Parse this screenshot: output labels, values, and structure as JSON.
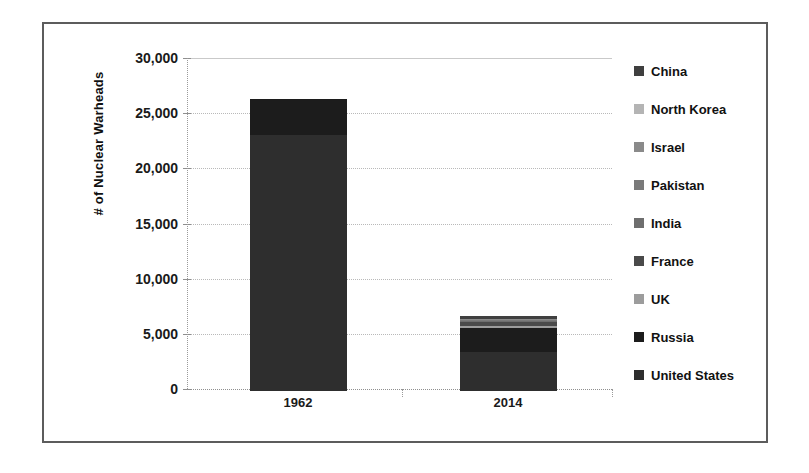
{
  "chart_data": {
    "type": "bar",
    "subtype": "stacked",
    "title": "",
    "xlabel": "",
    "ylabel": "# of Nuclear Warheads",
    "categories": [
      "1962",
      "2014"
    ],
    "ylim": [
      0,
      30000
    ],
    "yticks": [
      0,
      5000,
      10000,
      15000,
      20000,
      25000,
      30000
    ],
    "ytick_labels": [
      "0",
      "5,000",
      "10,000",
      "15,000",
      "20,000",
      "25,000",
      "30,000"
    ],
    "grid": true,
    "legend_position": "right",
    "series": [
      {
        "name": "China",
        "color": "#3f3f3f",
        "values": [
          0,
          250
        ]
      },
      {
        "name": "North Korea",
        "color": "#b4b4b4",
        "values": [
          0,
          10
        ]
      },
      {
        "name": "Israel",
        "color": "#8a8a8a",
        "values": [
          0,
          80
        ]
      },
      {
        "name": "Pakistan",
        "color": "#7a7a7a",
        "values": [
          0,
          120
        ]
      },
      {
        "name": "India",
        "color": "#6e6e6e",
        "values": [
          0,
          110
        ]
      },
      {
        "name": "France",
        "color": "#4a4a4a",
        "values": [
          0,
          300
        ]
      },
      {
        "name": "UK",
        "color": "#9c9c9c",
        "values": [
          0,
          225
        ]
      },
      {
        "name": "Russia",
        "color": "#1c1c1c",
        "values": [
          3300,
          2200
        ]
      },
      {
        "name": "United States",
        "color": "#2e2e2e",
        "values": [
          23200,
          3500
        ]
      }
    ],
    "totals": [
      26500,
      6495
    ]
  },
  "axis": {
    "y_title": "# of Nuclear Warheads",
    "ytick_labels": [
      "30,000",
      "25,000",
      "20,000",
      "15,000",
      "10,000",
      "5,000",
      "0"
    ],
    "xtick_labels": [
      "1962",
      "2014"
    ]
  },
  "legend": {
    "items": [
      {
        "label": "China",
        "color": "#3f3f3f"
      },
      {
        "label": "North Korea",
        "color": "#b4b4b4"
      },
      {
        "label": "Israel",
        "color": "#8a8a8a"
      },
      {
        "label": "Pakistan",
        "color": "#7a7a7a"
      },
      {
        "label": "India",
        "color": "#6e6e6e"
      },
      {
        "label": "France",
        "color": "#4a4a4a"
      },
      {
        "label": "UK",
        "color": "#9c9c9c"
      },
      {
        "label": "Russia",
        "color": "#1c1c1c"
      },
      {
        "label": "United States",
        "color": "#2e2e2e"
      }
    ]
  }
}
